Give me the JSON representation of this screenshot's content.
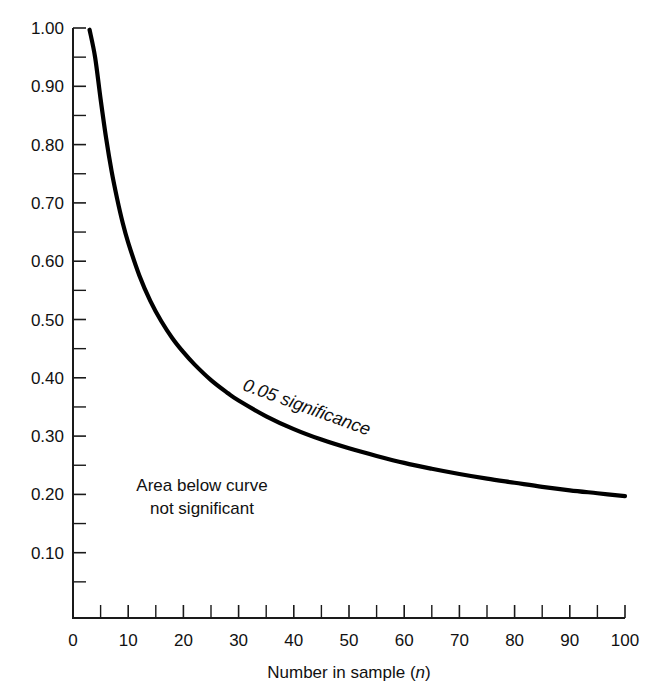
{
  "chart_data": {
    "type": "line",
    "title": "",
    "xlabel": "Number in sample (n)",
    "xlabel_plain": "Number in sample",
    "xlabel_italic_symbol": "n",
    "ylabel": "",
    "xlim": [
      0,
      100
    ],
    "ylim": [
      0,
      1.0
    ],
    "grid": false,
    "legend": "none",
    "x_ticks": [
      0,
      10,
      20,
      30,
      40,
      50,
      60,
      70,
      80,
      90,
      100
    ],
    "x_tick_labels": [
      "0",
      "10",
      "20",
      "30",
      "40",
      "50",
      "60",
      "70",
      "80",
      "90",
      "100"
    ],
    "x_minor_ticks": [
      5,
      15,
      25,
      35,
      45,
      55,
      65,
      75,
      85,
      95
    ],
    "y_ticks": [
      0.1,
      0.2,
      0.3,
      0.4,
      0.5,
      0.6,
      0.7,
      0.8,
      0.9,
      1.0
    ],
    "y_tick_labels": [
      "0.10",
      "0.20",
      "0.30",
      "0.40",
      "0.50",
      "0.60",
      "0.70",
      "0.80",
      "0.90",
      "1.00"
    ],
    "y_minor_ticks": [
      0.05,
      0.15,
      0.25,
      0.35,
      0.45,
      0.55,
      0.65,
      0.75,
      0.85,
      0.95
    ],
    "series": [
      {
        "name": "0.05 significance",
        "color": "#000000",
        "x": [
          3,
          4,
          5,
          6,
          7,
          8,
          9,
          10,
          12,
          14,
          16,
          18,
          20,
          22,
          25,
          28,
          30,
          35,
          40,
          45,
          50,
          55,
          60,
          65,
          70,
          75,
          80,
          85,
          90,
          95,
          100
        ],
        "y": [
          0.997,
          0.95,
          0.878,
          0.811,
          0.754,
          0.707,
          0.666,
          0.632,
          0.576,
          0.532,
          0.497,
          0.468,
          0.444,
          0.423,
          0.396,
          0.374,
          0.361,
          0.334,
          0.312,
          0.294,
          0.279,
          0.266,
          0.254,
          0.244,
          0.235,
          0.227,
          0.22,
          0.213,
          0.207,
          0.202,
          0.197
        ]
      }
    ],
    "annotations": [
      {
        "name": "curve-label",
        "text": "0.05 significance",
        "style": "italic",
        "x_data": 42,
        "y_data": 0.34,
        "rotation_deg": 20
      },
      {
        "name": "area-note",
        "lines": [
          "Area below curve",
          "not significant"
        ],
        "x_data": 20,
        "y_data": 0.155
      }
    ]
  },
  "colors": {
    "background": "#ffffff",
    "axis": "#1a1a1a",
    "curve": "#000000",
    "text": "#111111"
  }
}
